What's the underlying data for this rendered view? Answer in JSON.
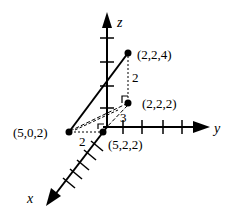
{
  "diagram": {
    "type": "3d-coordinate-axes",
    "axes": {
      "x": {
        "label": "x"
      },
      "y": {
        "label": "y"
      },
      "z": {
        "label": "z"
      }
    },
    "points": [
      {
        "id": "p1",
        "label": "(2,2,4)"
      },
      {
        "id": "p2",
        "label": "(2,2,2)"
      },
      {
        "id": "p3",
        "label": "(5,0,2)"
      },
      {
        "id": "p4",
        "label": "(5,2,2)"
      }
    ],
    "segment_labels": {
      "vertical": "2",
      "diagonal": "3",
      "horizontal": "2"
    },
    "colors": {
      "ink": "#000000",
      "background": "#ffffff"
    }
  }
}
